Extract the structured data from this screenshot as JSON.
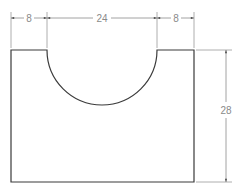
{
  "drawing": {
    "type": "technical-drawing",
    "part": "rectangular block with semicircular cutout",
    "colors": {
      "background": "#ffffff",
      "outline": "#3a3a3a",
      "dimension": "#8a8a8a"
    },
    "dimensions": {
      "left_flat": "8",
      "cutout_width": "24",
      "right_flat": "8",
      "height": "28"
    }
  }
}
